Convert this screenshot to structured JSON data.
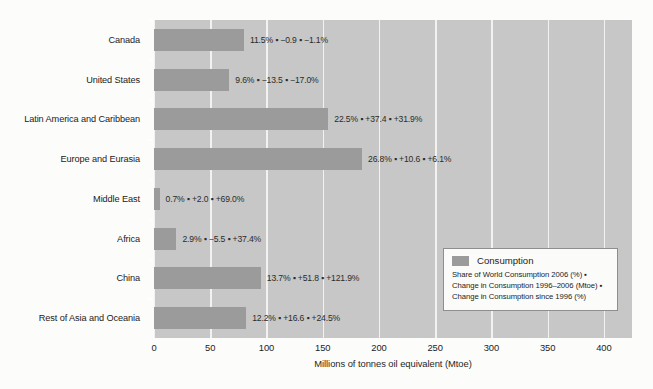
{
  "chart_data": {
    "type": "bar",
    "orientation": "horizontal",
    "title": "",
    "xlabel": "Millions of tonnes oil equivalent (Mtoe)",
    "ylabel": "",
    "xlim": [
      0,
      425
    ],
    "xticks": [
      0,
      50,
      100,
      150,
      200,
      250,
      300,
      350,
      400
    ],
    "grid": true,
    "legend_position": "bottom-right",
    "series_name": "Consumption",
    "bar_color": "#9a9b9a",
    "plot_background": "#c6c7c6",
    "gridline_color": "#f2f2f0",
    "categories": [
      "Canada",
      "United States",
      "Latin America and Caribbean",
      "Europe and Eurasia",
      "Middle East",
      "Africa",
      "China",
      "Rest of Asia and Oceania"
    ],
    "values": [
      80,
      67,
      155,
      185,
      5,
      20,
      95,
      82
    ],
    "point_labels": [
      "11.5% ▪ −0.9 ▪ −1.1%",
      "9.6% ▪ −13.5 ▪ −17.0%",
      "22.5% ▪ +37.4 ▪ +31.9%",
      "26.8% ▪ +10.6 ▪ +6.1%",
      "0.7% ▪ +2.0 ▪ +69.0%",
      "2.9% ▪ −5.5 ▪ +37.4%",
      "13.7% ▪ +51.8 ▪ +121.9%",
      "12.2% ▪ +16.6 ▪ +24.5%"
    ],
    "share_of_world_consumption_2006_pct": [
      11.5,
      9.6,
      22.5,
      26.8,
      0.7,
      2.9,
      13.7,
      12.2
    ],
    "change_in_consumption_1996_2006_mtoe": [
      -0.9,
      -13.5,
      37.4,
      10.6,
      2.0,
      -5.5,
      51.8,
      16.6
    ],
    "change_in_consumption_since_1996_pct": [
      -1.1,
      -17.0,
      31.9,
      6.1,
      69.0,
      37.4,
      121.9,
      24.5
    ]
  },
  "legend": {
    "title": "Consumption",
    "description": "Share of World Consumption 2006 (%) ▪ Change in Consumption 1996–2006 (Mtoe) ▪ Change in Consumption since 1996 (%)"
  }
}
